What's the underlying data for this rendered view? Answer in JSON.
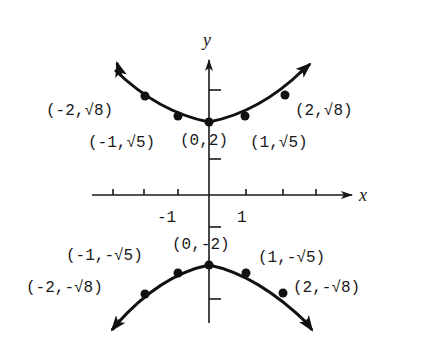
{
  "diagram": {
    "type": "graph-of-relation",
    "axes": {
      "x_label": "x",
      "y_label": "y",
      "x_tick_labels": [
        {
          "value": -1,
          "text": "-1"
        },
        {
          "value": 1,
          "text": "1"
        }
      ]
    },
    "upper_branch": {
      "points": [
        {
          "x": -2,
          "y": "√8",
          "label": "(-2,√8)"
        },
        {
          "x": -1,
          "y": "√5",
          "label": "(-1,√5)"
        },
        {
          "x": 0,
          "y": "2",
          "label": "(0,2)"
        },
        {
          "x": 1,
          "y": "√5",
          "label": "(1,√5)"
        },
        {
          "x": 2,
          "y": "√8",
          "label": "(2,√8)"
        }
      ]
    },
    "lower_branch": {
      "points": [
        {
          "x": -2,
          "y": "-√8",
          "label": "(-2,-√8)"
        },
        {
          "x": -1,
          "y": "-√5",
          "label": "(-1,-√5)"
        },
        {
          "x": 0,
          "y": "-2",
          "label": "(0,-2)"
        },
        {
          "x": 1,
          "y": "-√5",
          "label": "(1,-√5)"
        },
        {
          "x": 2,
          "y": "-√8",
          "label": "(2,-√8)"
        }
      ]
    },
    "colors": {
      "ink": "#111111",
      "background": "#ffffff"
    }
  }
}
